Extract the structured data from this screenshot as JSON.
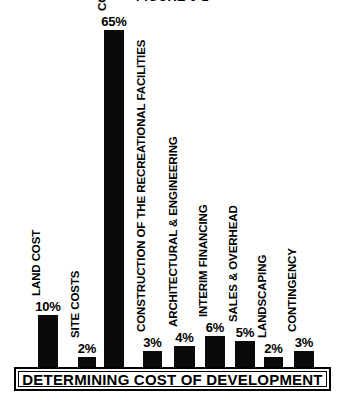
{
  "chart_data": {
    "type": "bar",
    "title": "FIGURE 6-1",
    "xlabel": "DETERMINING COST OF DEVELOPMENT",
    "ylabel": "",
    "ylim": [
      0,
      65
    ],
    "grid": false,
    "legend": "none",
    "value_suffix": "%",
    "categories": [
      "LAND COST",
      "SITE COSTS",
      "CONSTRUCTION OF THE UNITS",
      "CONSTRUCTION OF THE RECREATIONAL FACILITIES",
      "ARCHITECTURAL & ENGINEERING",
      "INTERIM FINANCING",
      "SALES & OVERHEAD",
      "LANDSCAPING",
      "CONTINGENCY"
    ],
    "values": [
      10,
      2,
      65,
      3,
      4,
      6,
      5,
      2,
      3
    ],
    "value_labels": [
      "10%",
      "2%",
      "65%",
      "3%",
      "4%",
      "6%",
      "5%",
      "2%",
      "3%"
    ],
    "bar_color": "#0a0a0a",
    "background_color": "#ffffff"
  },
  "bars": [
    {
      "label": "LAND COST",
      "value_label": "10%",
      "value": 10
    },
    {
      "label": "SITE COSTS",
      "value_label": "2%",
      "value": 2
    },
    {
      "label": "CONSTRUCTION OF THE UNITS",
      "value_label": "65%",
      "value": 65
    },
    {
      "label": "CONSTRUCTION OF THE RECREATIONAL FACILITIES",
      "value_label": "3%",
      "value": 3
    },
    {
      "label": "ARCHITECTURAL & ENGINEERING",
      "value_label": "4%",
      "value": 4
    },
    {
      "label": "INTERIM FINANCING",
      "value_label": "6%",
      "value": 6
    },
    {
      "label": "SALES & OVERHEAD",
      "value_label": "5%",
      "value": 5
    },
    {
      "label": "LANDSCAPING",
      "value_label": "2%",
      "value": 2
    },
    {
      "label": "CONTINGENCY",
      "value_label": "3%",
      "value": 3
    }
  ],
  "axis_caption": "DETERMINING COST OF DEVELOPMENT",
  "figure_title": "FIGURE 6-1"
}
